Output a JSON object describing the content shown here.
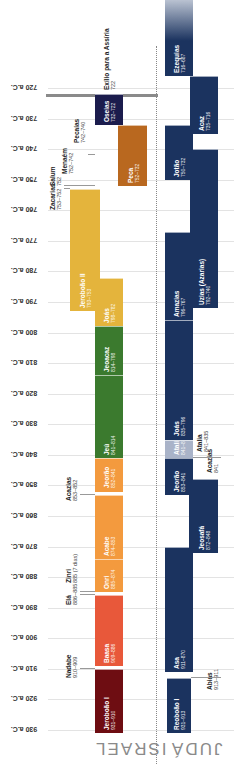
{
  "chart_data": {
    "type": "timeline",
    "title": "",
    "orientation": "vertical (rotated text)",
    "axis": {
      "unit": "a.C.",
      "ticks": [
        "720 a.C.",
        "730 a.C.",
        "740 a.C.",
        "750 a.C.",
        "760 a.C.",
        "770 a.C.",
        "780 a.C.",
        "790 a.C.",
        "800 a.C.",
        "810 a.C.",
        "820 a.C.",
        "830 a.C.",
        "840 a.C.",
        "850 a.C.",
        "860 a.C.",
        "870 a.C.",
        "880 a.C.",
        "890 a.C.",
        "900 a.C.",
        "910 a.C.",
        "920 a.C.",
        "930 a.C."
      ],
      "range": [
        715,
        935
      ],
      "grid": true
    },
    "kingdoms": [
      {
        "name": "ISRAEL",
        "kings": [
          {
            "name": "Jeroboão I",
            "years": "931–910",
            "start": 931,
            "end": 910,
            "color": "#6e0d12",
            "in_bar": true
          },
          {
            "name": "Nadabe",
            "years": "910–909",
            "start": 910,
            "end": 909,
            "color": "#8c1a16",
            "in_bar": false
          },
          {
            "name": "Baasa",
            "years": "909–886",
            "start": 909,
            "end": 886,
            "color": "#e8583a",
            "in_bar": true
          },
          {
            "name": "Elá",
            "years": "886–885",
            "start": 886,
            "end": 885,
            "color": "#e8583a",
            "in_bar": false
          },
          {
            "name": "Zinri",
            "years": "885 (7 dias)",
            "start": 885,
            "end": 885,
            "color": "#f39a3e",
            "in_bar": false
          },
          {
            "name": "Onri",
            "years": "885–874",
            "start": 885,
            "end": 874,
            "color": "#f39a3e",
            "in_bar": true
          },
          {
            "name": "Acabe",
            "years": "874–853",
            "start": 874,
            "end": 853,
            "color": "#f39a3e",
            "in_bar": true
          },
          {
            "name": "Acazias",
            "years": "853–852",
            "start": 853,
            "end": 852,
            "color": "#f39a3e",
            "in_bar": false
          },
          {
            "name": "Jeorão",
            "years": "852–841",
            "start": 852,
            "end": 841,
            "color": "#f39a3e",
            "in_bar": true
          },
          {
            "name": "Jeú",
            "years": "841–814",
            "start": 841,
            "end": 814,
            "color": "#3b7a2e",
            "in_bar": true
          },
          {
            "name": "Jeoacaz",
            "years": "814–798",
            "start": 814,
            "end": 798,
            "color": "#3b7a2e",
            "in_bar": true
          },
          {
            "name": "Joás",
            "years": "798–782",
            "start": 798,
            "end": 782,
            "color": "#e4b43c",
            "in_bar": true
          },
          {
            "name": "Jeroboão II",
            "years": "793–753",
            "start": 793,
            "end": 753,
            "color": "#e4b43c",
            "in_bar": true
          },
          {
            "name": "Zacarias",
            "years": "753–752",
            "start": 753,
            "end": 752,
            "color": "#e4b43c",
            "in_bar": false
          },
          {
            "name": "Salum",
            "years": "752",
            "start": 752,
            "end": 752,
            "color": "#3f8fa3",
            "in_bar": false
          },
          {
            "name": "Menaém",
            "years": "752–742",
            "start": 752,
            "end": 742,
            "color": "#3f8fa3",
            "in_bar": false
          },
          {
            "name": "Pecaías",
            "years": "742–740",
            "start": 742,
            "end": 740,
            "color": "#3f8fa3",
            "in_bar": false
          },
          {
            "name": "Peca",
            "years": "752–732",
            "start": 752,
            "end": 732,
            "color": "#b9681f",
            "in_bar": true
          },
          {
            "name": "Oseias",
            "years": "732–722",
            "start": 732,
            "end": 722,
            "color": "#1b1c4d",
            "in_bar": true
          }
        ],
        "event": {
          "name": "Exílio para a Assíria",
          "years": "722"
        }
      },
      {
        "name": "JUDÁ",
        "kings": [
          {
            "name": "Reoboão I",
            "years": "931–913",
            "start": 931,
            "end": 913,
            "color": "#1b335f",
            "in_bar": true
          },
          {
            "name": "Abias",
            "years": "913–911",
            "start": 913,
            "end": 911,
            "color": "#1b335f",
            "in_bar": false
          },
          {
            "name": "Asa",
            "years": "911–870",
            "start": 911,
            "end": 870,
            "color": "#1b335f",
            "in_bar": true
          },
          {
            "name": "Jeosafá",
            "years": "872–848",
            "start": 872,
            "end": 848,
            "color": "#1b335f",
            "in_bar": true
          },
          {
            "name": "Jeorão",
            "years": "853–841",
            "start": 853,
            "end": 841,
            "color": "#1b335f",
            "in_bar": true
          },
          {
            "name": "Acazias",
            "years": "841",
            "start": 841,
            "end": 841,
            "color": "#1b335f",
            "in_bar": false
          },
          {
            "name": "Atalia",
            "years": "841–835",
            "start": 841,
            "end": 835,
            "color": "#a9b3c8",
            "in_bar": false
          },
          {
            "name": "Joás",
            "years": "835–796",
            "start": 835,
            "end": 796,
            "color": "#1b335f",
            "in_bar": true
          },
          {
            "name": "Amazias",
            "years": "796–767",
            "start": 796,
            "end": 767,
            "color": "#1b335f",
            "in_bar": true
          },
          {
            "name": "Uzias (Azarias)",
            "years": "792–740",
            "start": 792,
            "end": 740,
            "color": "#1b335f",
            "in_bar": true
          },
          {
            "name": "Jotão",
            "years": "750–732",
            "start": 750,
            "end": 732,
            "color": "#1b335f",
            "in_bar": true
          },
          {
            "name": "Acaz",
            "years": "735–716",
            "start": 735,
            "end": 716,
            "color": "#1b335f",
            "in_bar": true
          },
          {
            "name": "Ezequias",
            "years": "716–687",
            "start": 716,
            "end": 687,
            "color": "#1b335f",
            "in_bar": true
          }
        ]
      }
    ]
  },
  "labels": {
    "israel": "ISRAEL",
    "juda": "JUDÁ",
    "exile_name": "Exílio para a Assíria",
    "exile_year": "722"
  }
}
